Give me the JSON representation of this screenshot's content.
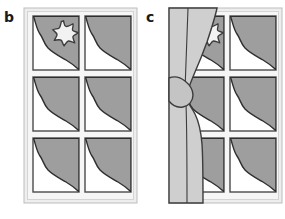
{
  "figure": {
    "type": "diagram",
    "background_color": "#ffffff",
    "panels": [
      {
        "id": "b",
        "label": "b",
        "name": "window-unoccluded",
        "caption_text": "b",
        "occluded": false,
        "window": {
          "frame_color": "#eeeeee",
          "frame_highlight_color": "#f8f8f8",
          "frame_shadow_color": "#c9c9c9",
          "outline_color": "#4a4a4a",
          "pane_glass_color": "#ffffff",
          "pane_shade_color": "#9e9e9e",
          "columns": 2,
          "rows": 3,
          "pane_count": 6
        },
        "star": {
          "name": "star-shape",
          "points": 6,
          "fill_color": "#f2f2f2",
          "outline_color": "#3c3c3c",
          "visible": "fully-visible",
          "located_in_pane": "top-left"
        }
      },
      {
        "id": "c",
        "label": "c",
        "name": "window-occluded-by-curtain",
        "caption_text": "c",
        "occluded": true,
        "window": {
          "frame_color": "#eeeeee",
          "frame_highlight_color": "#f8f8f8",
          "frame_shadow_color": "#c9c9c9",
          "outline_color": "#4a4a4a",
          "pane_glass_color": "#ffffff",
          "pane_shade_color": "#9e9e9e",
          "columns": 2,
          "rows": 3,
          "pane_count": 6
        },
        "curtain": {
          "name": "curtain-drape",
          "fill_color": "#cfcfcf",
          "fill_shadow_color": "#bdbdbd",
          "outline_color": "#3c3c3c",
          "has_tieback": true,
          "tieback_name": "curtain-tieback-knot",
          "side": "left"
        },
        "star": {
          "name": "star-shape",
          "points": 6,
          "fill_color": "#f2f2f2",
          "outline_color": "#3c3c3c",
          "visible": "partially-occluded",
          "located_in_pane": "top-left"
        }
      }
    ]
  },
  "colors": {
    "ink": "#1a1a1a",
    "outline": "#3c3c3c",
    "frame": "#eeeeee",
    "frame_light": "#f8f8f8",
    "frame_dark": "#c9c9c9",
    "shade": "#9e9e9e",
    "curtain": "#cfcfcf",
    "curtain_dark": "#bdbdbd",
    "glass": "#ffffff",
    "star": "#f2f2f2"
  }
}
